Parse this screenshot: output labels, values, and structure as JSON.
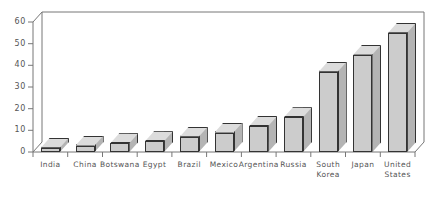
{
  "chart_data": {
    "type": "bar",
    "title": "",
    "xlabel": "",
    "ylabel": "",
    "ylim": [
      0,
      60
    ],
    "yticks": [
      0,
      10,
      20,
      30,
      40,
      50,
      60
    ],
    "grid": false,
    "legend": "none",
    "style": "3d-bar",
    "bar_color": "#cccccc",
    "bar_top_color": "#dcdcdc",
    "bar_side_color": "#b4b4b4",
    "bar_edge_color": "#333333",
    "axis_color": "#555555",
    "categories": [
      "India",
      "China",
      "Botswana",
      "Egypt",
      "Brazil",
      "Mexico",
      "Argentina",
      "Russia",
      "South\nKorea",
      "Japan",
      "United\nStates"
    ],
    "values": [
      2,
      3,
      4,
      5,
      7,
      9,
      12,
      16,
      37,
      45,
      55
    ]
  },
  "yticks_text": [
    "60",
    "50",
    "40",
    "30",
    "20",
    "10",
    "0"
  ]
}
